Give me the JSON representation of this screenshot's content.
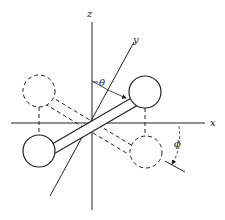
{
  "diagram": {
    "axes": {
      "x_label": "x",
      "y_label": "y",
      "z_label": "z"
    },
    "angles": {
      "theta_label": "θ",
      "phi_label": "ϕ"
    },
    "colors": {
      "line": "#222222",
      "background": "#ffffff"
    }
  }
}
